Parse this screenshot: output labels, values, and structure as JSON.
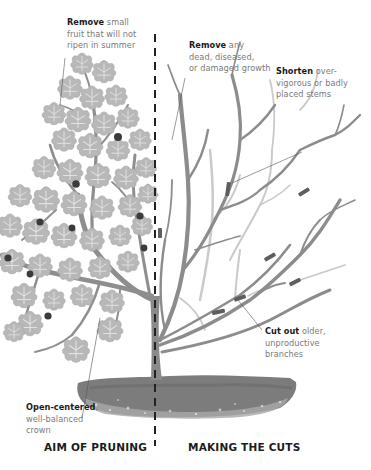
{
  "diagram": {
    "palette": {
      "background": "#ffffff",
      "branch_dark": "#8a8a8a",
      "branch_light": "#c8c8c8",
      "leaf": "#b5b5b5",
      "leaf_vein": "#e6e6e6",
      "fruit": "#3a3a3a",
      "cut_mark": "#5c5c5c",
      "soil": "#7d7d7d",
      "divider": "#222222",
      "text_bold": "#1a1a1a",
      "text_regular": "#7a7a7a"
    },
    "callouts": {
      "remove_fruit": {
        "bold": "Remove",
        "text_1": " small",
        "text_2": "fruit that will not",
        "text_3": "ripen in summer"
      },
      "remove_dead": {
        "bold": "Remove",
        "text_1": " any",
        "text_2": "dead, diseased,",
        "text_3": "or damaged growth"
      },
      "shorten": {
        "bold": "Shorten",
        "text_1": " over-",
        "text_2": "vigorous or badly",
        "text_3": "placed stems"
      },
      "cut_out": {
        "bold": "Cut out",
        "text_1": " older,",
        "text_2": "unproductive",
        "text_3": "branches"
      },
      "open_centered": {
        "bold": "Open-centered",
        "text_1": ",",
        "text_2": "well-balanced",
        "text_3": "crown"
      }
    },
    "sections": {
      "left": "AIM OF PRUNING",
      "right": "MAKING THE CUTS"
    }
  }
}
